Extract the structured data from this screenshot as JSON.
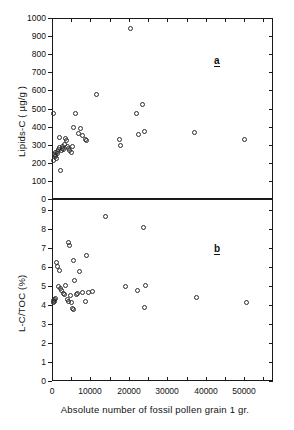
{
  "figure": {
    "panel_a_label": "a",
    "panel_b_label": "b",
    "xtitle": "Absolute number of fossil pollen  grain 1 gr."
  },
  "chart_data": [
    {
      "type": "scatter",
      "panel": "a",
      "title": "",
      "xlabel": "Absolute number of fossil pollen grain 1 gr.",
      "ylabel": "Lipids-C ( µg/g )",
      "xlim": [
        0,
        57500
      ],
      "ylim": [
        0,
        1000
      ],
      "xticks": [
        0,
        5000,
        10000,
        15000,
        20000,
        25000,
        30000,
        35000,
        40000,
        45000,
        50000,
        55000
      ],
      "xtick_labels": [
        "",
        "",
        "",
        "",
        "",
        "",
        "",
        "",
        "",
        "",
        "",
        ""
      ],
      "yticks": [
        0,
        100,
        200,
        300,
        400,
        500,
        600,
        700,
        800,
        900,
        1000
      ],
      "ytick_labels": [
        "0",
        "100",
        "200",
        "300",
        "400",
        "500",
        "600",
        "700",
        "800",
        "900",
        "1000"
      ],
      "grid": false,
      "legend": false,
      "marker": "open-circle",
      "points": [
        [
          300,
          470
        ],
        [
          500,
          215
        ],
        [
          700,
          245
        ],
        [
          800,
          235
        ],
        [
          900,
          255
        ],
        [
          1000,
          240
        ],
        [
          1100,
          225
        ],
        [
          1300,
          262
        ],
        [
          1500,
          250
        ],
        [
          1700,
          272
        ],
        [
          1900,
          285
        ],
        [
          2000,
          340
        ],
        [
          2200,
          158
        ],
        [
          2400,
          268
        ],
        [
          2600,
          282
        ],
        [
          2800,
          290
        ],
        [
          3000,
          276
        ],
        [
          3300,
          300
        ],
        [
          3500,
          332
        ],
        [
          3700,
          325
        ],
        [
          4000,
          288
        ],
        [
          4300,
          278
        ],
        [
          4600,
          268
        ],
        [
          5000,
          257
        ],
        [
          5300,
          292
        ],
        [
          5600,
          397
        ],
        [
          6200,
          470
        ],
        [
          6800,
          360
        ],
        [
          7400,
          388
        ],
        [
          8000,
          352
        ],
        [
          8600,
          330
        ],
        [
          8900,
          325
        ],
        [
          11500,
          580
        ],
        [
          17500,
          330
        ],
        [
          17800,
          297
        ],
        [
          20500,
          940
        ],
        [
          22000,
          472
        ],
        [
          22400,
          358
        ],
        [
          23500,
          525
        ],
        [
          24000,
          375
        ],
        [
          37000,
          365
        ],
        [
          50000,
          330
        ]
      ]
    },
    {
      "type": "scatter",
      "panel": "b",
      "title": "",
      "xlabel": "Absolute number of fossil pollen grain 1 gr.",
      "ylabel": "L-C/TOC (%)",
      "xlim": [
        0,
        57500
      ],
      "ylim": [
        0,
        9.6
      ],
      "xticks": [
        0,
        5000,
        10000,
        15000,
        20000,
        25000,
        30000,
        35000,
        40000,
        45000,
        50000,
        55000
      ],
      "xtick_labels": [
        "0",
        "",
        "10000",
        "",
        "20000",
        "",
        "30000",
        "",
        "40000",
        "",
        "50000",
        ""
      ],
      "yticks": [
        0,
        1,
        2,
        3,
        4,
        5,
        6,
        7,
        8,
        9
      ],
      "ytick_labels": [
        "0",
        "1",
        "2",
        "3",
        "4",
        "5",
        "6",
        "7",
        "8",
        "9"
      ],
      "grid": false,
      "legend": false,
      "marker": "open-circle",
      "points": [
        [
          300,
          4.25
        ],
        [
          400,
          4.15
        ],
        [
          600,
          4.3
        ],
        [
          700,
          4.2
        ],
        [
          900,
          4.35
        ],
        [
          1100,
          6.25
        ],
        [
          1300,
          6.05
        ],
        [
          1600,
          5.0
        ],
        [
          1900,
          5.85
        ],
        [
          2200,
          4.9
        ],
        [
          2500,
          4.75
        ],
        [
          2900,
          4.6
        ],
        [
          3300,
          4.55
        ],
        [
          3600,
          5.05
        ],
        [
          3900,
          4.3
        ],
        [
          4200,
          4.2
        ],
        [
          4400,
          7.3
        ],
        [
          4600,
          7.15
        ],
        [
          4800,
          4.5
        ],
        [
          5000,
          4.15
        ],
        [
          5200,
          3.85
        ],
        [
          5500,
          3.75
        ],
        [
          5700,
          6.35
        ],
        [
          5900,
          5.3
        ],
        [
          6300,
          4.55
        ],
        [
          6700,
          4.6
        ],
        [
          7200,
          5.8
        ],
        [
          8000,
          4.65
        ],
        [
          8600,
          4.2
        ],
        [
          9000,
          6.6
        ],
        [
          9600,
          4.65
        ],
        [
          10600,
          4.7
        ],
        [
          14000,
          8.7
        ],
        [
          19000,
          5.0
        ],
        [
          22300,
          4.8
        ],
        [
          23800,
          8.1
        ],
        [
          24200,
          5.05
        ],
        [
          24000,
          3.9
        ],
        [
          37500,
          4.4
        ],
        [
          50500,
          4.15
        ]
      ]
    }
  ]
}
